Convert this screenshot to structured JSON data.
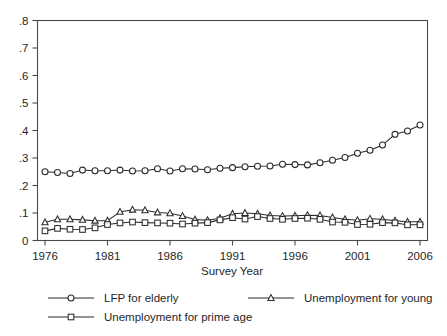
{
  "chart_data": {
    "type": "line",
    "title": "",
    "xlabel": "Survey Year",
    "ylabel": "",
    "xlim": [
      1975.4,
      2006.6
    ],
    "ylim": [
      0,
      0.8
    ],
    "grid": false,
    "legend_position": "bottom",
    "xticks": [
      1976,
      1981,
      1986,
      1991,
      1996,
      2001,
      2006
    ],
    "xtick_labels": [
      "1976",
      "1981",
      "1986",
      "1991",
      "1996",
      "2001",
      "2006"
    ],
    "yticks": [
      0,
      0.1,
      0.2,
      0.3,
      0.4,
      0.5,
      0.6,
      0.7,
      0.8
    ],
    "ytick_labels": [
      "0",
      ".1",
      ".2",
      ".3",
      ".4",
      ".5",
      ".6",
      ".7",
      ".8"
    ],
    "x": [
      1976,
      1977,
      1978,
      1979,
      1980,
      1981,
      1982,
      1983,
      1984,
      1985,
      1986,
      1987,
      1988,
      1989,
      1990,
      1991,
      1992,
      1993,
      1994,
      1995,
      1996,
      1997,
      1998,
      1999,
      2000,
      2001,
      2002,
      2003,
      2004,
      2005,
      2006
    ],
    "series": [
      {
        "name": "LFP for elderly",
        "marker": "circle",
        "values": [
          0.25,
          0.247,
          0.244,
          0.256,
          0.254,
          0.254,
          0.256,
          0.253,
          0.254,
          0.261,
          0.253,
          0.261,
          0.26,
          0.257,
          0.263,
          0.265,
          0.268,
          0.27,
          0.271,
          0.277,
          0.276,
          0.275,
          0.283,
          0.292,
          0.302,
          0.317,
          0.328,
          0.347,
          0.386,
          0.398,
          0.42
        ]
      },
      {
        "name": "Unemployment for young",
        "marker": "triangle",
        "values": [
          0.066,
          0.077,
          0.077,
          0.075,
          0.072,
          0.072,
          0.104,
          0.112,
          0.11,
          0.102,
          0.099,
          0.089,
          0.076,
          0.074,
          0.081,
          0.097,
          0.1,
          0.097,
          0.091,
          0.089,
          0.09,
          0.092,
          0.091,
          0.084,
          0.077,
          0.074,
          0.079,
          0.077,
          0.072,
          0.068,
          0.068
        ]
      },
      {
        "name": "Unemployment for prime age",
        "marker": "square",
        "values": [
          0.035,
          0.044,
          0.041,
          0.04,
          0.046,
          0.058,
          0.064,
          0.067,
          0.065,
          0.064,
          0.063,
          0.06,
          0.063,
          0.065,
          0.075,
          0.083,
          0.078,
          0.087,
          0.08,
          0.077,
          0.08,
          0.081,
          0.077,
          0.067,
          0.066,
          0.058,
          0.059,
          0.065,
          0.064,
          0.057,
          0.057
        ]
      }
    ],
    "colors": {
      "line": "#2b2b2b",
      "marker_fill": "#ffffff",
      "axis": "#4a4a4a",
      "text": "#1f1f1f",
      "background": "#ffffff"
    }
  },
  "legend": {
    "entries": [
      {
        "label": "LFP for elderly",
        "marker": "circle"
      },
      {
        "label": "Unemployment for young",
        "marker": "triangle"
      },
      {
        "label": "Unemployment for prime age",
        "marker": "square"
      }
    ]
  }
}
